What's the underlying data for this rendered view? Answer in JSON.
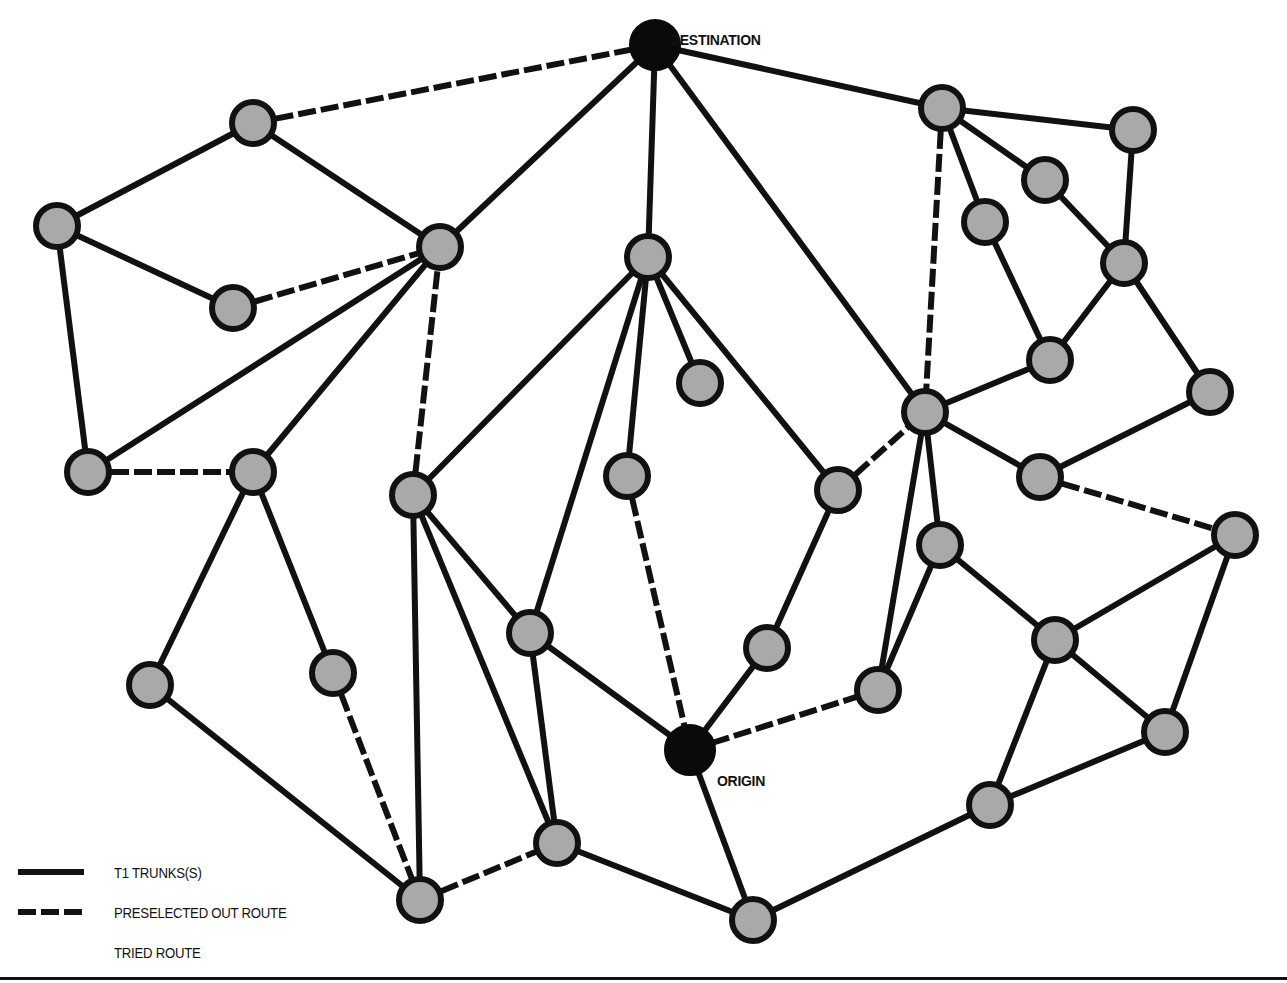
{
  "diagram": {
    "title": "",
    "colors": {
      "line": "#111111",
      "node_fill": "#a9a9a9",
      "endpoint_fill": "#0a0a0a",
      "background": "#ffffff"
    },
    "labels": {
      "destination": "DESTINATION",
      "origin": "ORIGIN"
    },
    "nodes": [
      {
        "id": 0,
        "x": 655,
        "y": 45,
        "type": "destination",
        "label": "DESTINATION"
      },
      {
        "id": 1,
        "x": 253,
        "y": 123
      },
      {
        "id": 2,
        "x": 57,
        "y": 226
      },
      {
        "id": 3,
        "x": 233,
        "y": 308
      },
      {
        "id": 4,
        "x": 440,
        "y": 247
      },
      {
        "id": 5,
        "x": 88,
        "y": 472
      },
      {
        "id": 6,
        "x": 253,
        "y": 472
      },
      {
        "id": 7,
        "x": 413,
        "y": 495
      },
      {
        "id": 8,
        "x": 648,
        "y": 257
      },
      {
        "id": 9,
        "x": 700,
        "y": 383
      },
      {
        "id": 10,
        "x": 627,
        "y": 476
      },
      {
        "id": 11,
        "x": 838,
        "y": 490
      },
      {
        "id": 12,
        "x": 530,
        "y": 633
      },
      {
        "id": 13,
        "x": 767,
        "y": 648
      },
      {
        "id": 14,
        "x": 150,
        "y": 685
      },
      {
        "id": 15,
        "x": 333,
        "y": 673
      },
      {
        "id": 16,
        "x": 420,
        "y": 900
      },
      {
        "id": 17,
        "x": 557,
        "y": 843
      },
      {
        "id": 18,
        "x": 690,
        "y": 750,
        "type": "origin",
        "label": "ORIGIN"
      },
      {
        "id": 19,
        "x": 753,
        "y": 920
      },
      {
        "id": 20,
        "x": 942,
        "y": 108
      },
      {
        "id": 21,
        "x": 1133,
        "y": 130
      },
      {
        "id": 22,
        "x": 1045,
        "y": 180
      },
      {
        "id": 23,
        "x": 985,
        "y": 222
      },
      {
        "id": 24,
        "x": 1124,
        "y": 263
      },
      {
        "id": 25,
        "x": 1050,
        "y": 360
      },
      {
        "id": 26,
        "x": 1210,
        "y": 392
      },
      {
        "id": 27,
        "x": 925,
        "y": 412
      },
      {
        "id": 28,
        "x": 1040,
        "y": 477
      },
      {
        "id": 29,
        "x": 1235,
        "y": 535
      },
      {
        "id": 30,
        "x": 940,
        "y": 545
      },
      {
        "id": 31,
        "x": 1055,
        "y": 640
      },
      {
        "id": 32,
        "x": 878,
        "y": 690
      },
      {
        "id": 33,
        "x": 1165,
        "y": 732
      },
      {
        "id": 34,
        "x": 990,
        "y": 805
      }
    ],
    "edges": [
      {
        "from": 1,
        "to": 0,
        "style": "dashed"
      },
      {
        "from": 4,
        "to": 0,
        "style": "solid"
      },
      {
        "from": 8,
        "to": 0,
        "style": "solid"
      },
      {
        "from": 27,
        "to": 0,
        "style": "solid"
      },
      {
        "from": 20,
        "to": 0,
        "style": "solid"
      },
      {
        "from": 1,
        "to": 2,
        "style": "solid"
      },
      {
        "from": 1,
        "to": 4,
        "style": "solid"
      },
      {
        "from": 2,
        "to": 3,
        "style": "solid"
      },
      {
        "from": 2,
        "to": 5,
        "style": "solid"
      },
      {
        "from": 3,
        "to": 4,
        "style": "dashed"
      },
      {
        "from": 5,
        "to": 4,
        "style": "solid"
      },
      {
        "from": 6,
        "to": 4,
        "style": "solid"
      },
      {
        "from": 7,
        "to": 4,
        "style": "dashed"
      },
      {
        "from": 5,
        "to": 6,
        "style": "dashed"
      },
      {
        "from": 6,
        "to": 14,
        "style": "solid"
      },
      {
        "from": 6,
        "to": 15,
        "style": "solid"
      },
      {
        "from": 14,
        "to": 16,
        "style": "solid"
      },
      {
        "from": 15,
        "to": 16,
        "style": "dashed"
      },
      {
        "from": 7,
        "to": 16,
        "style": "solid"
      },
      {
        "from": 7,
        "to": 17,
        "style": "solid"
      },
      {
        "from": 7,
        "to": 12,
        "style": "solid"
      },
      {
        "from": 7,
        "to": 8,
        "style": "solid"
      },
      {
        "from": 16,
        "to": 17,
        "style": "dashed"
      },
      {
        "from": 12,
        "to": 17,
        "style": "solid"
      },
      {
        "from": 12,
        "to": 18,
        "style": "solid"
      },
      {
        "from": 12,
        "to": 8,
        "style": "solid"
      },
      {
        "from": 8,
        "to": 10,
        "style": "solid"
      },
      {
        "from": 8,
        "to": 9,
        "style": "solid"
      },
      {
        "from": 8,
        "to": 11,
        "style": "solid"
      },
      {
        "from": 10,
        "to": 18,
        "style": "dashed"
      },
      {
        "from": 11,
        "to": 13,
        "style": "solid"
      },
      {
        "from": 11,
        "to": 27,
        "style": "dashed"
      },
      {
        "from": 13,
        "to": 18,
        "style": "solid"
      },
      {
        "from": 18,
        "to": 32,
        "style": "dashed"
      },
      {
        "from": 18,
        "to": 19,
        "style": "solid"
      },
      {
        "from": 17,
        "to": 19,
        "style": "solid"
      },
      {
        "from": 19,
        "to": 34,
        "style": "solid"
      },
      {
        "from": 20,
        "to": 21,
        "style": "solid"
      },
      {
        "from": 20,
        "to": 22,
        "style": "solid"
      },
      {
        "from": 20,
        "to": 23,
        "style": "solid"
      },
      {
        "from": 20,
        "to": 27,
        "style": "dashed"
      },
      {
        "from": 21,
        "to": 24,
        "style": "solid"
      },
      {
        "from": 22,
        "to": 24,
        "style": "solid"
      },
      {
        "from": 23,
        "to": 25,
        "style": "solid"
      },
      {
        "from": 24,
        "to": 25,
        "style": "solid"
      },
      {
        "from": 24,
        "to": 26,
        "style": "solid"
      },
      {
        "from": 25,
        "to": 27,
        "style": "solid"
      },
      {
        "from": 27,
        "to": 28,
        "style": "solid"
      },
      {
        "from": 27,
        "to": 30,
        "style": "solid"
      },
      {
        "from": 27,
        "to": 32,
        "style": "solid"
      },
      {
        "from": 26,
        "to": 28,
        "style": "solid"
      },
      {
        "from": 28,
        "to": 29,
        "style": "dashed"
      },
      {
        "from": 30,
        "to": 32,
        "style": "solid"
      },
      {
        "from": 30,
        "to": 31,
        "style": "solid"
      },
      {
        "from": 29,
        "to": 31,
        "style": "solid"
      },
      {
        "from": 29,
        "to": 33,
        "style": "solid"
      },
      {
        "from": 31,
        "to": 33,
        "style": "solid"
      },
      {
        "from": 31,
        "to": 34,
        "style": "solid"
      },
      {
        "from": 33,
        "to": 34,
        "style": "solid"
      }
    ]
  },
  "legend": {
    "items": [
      {
        "style": "solid",
        "label": "T1 TRUNKS(S)"
      },
      {
        "style": "dashed",
        "label": "PRESELECTED OUT ROUTE"
      },
      {
        "style": "none",
        "label": "TRIED ROUTE"
      }
    ]
  }
}
